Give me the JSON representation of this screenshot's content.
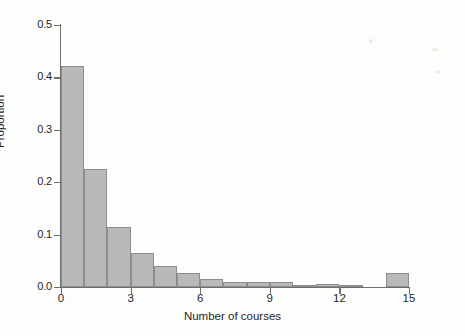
{
  "chart_data": {
    "type": "bar",
    "title": "",
    "subtitle": "",
    "xlabel": "Number of courses",
    "ylabel": "Proportion",
    "xlim": [
      0,
      15
    ],
    "ylim": [
      0,
      0.5
    ],
    "grid": false,
    "legend": null,
    "bin_width": 1,
    "x_ticks": [
      "0",
      "3",
      "6",
      "9",
      "12",
      "15"
    ],
    "x_tick_values": [
      0,
      3,
      6,
      9,
      12,
      15
    ],
    "y_ticks": [
      "0.0",
      "0.1",
      "0.2",
      "0.3",
      "0.4",
      "0.5"
    ],
    "y_tick_values": [
      0.0,
      0.1,
      0.2,
      0.3,
      0.4,
      0.5
    ],
    "bin_starts": [
      0,
      1,
      2,
      3,
      4,
      5,
      6,
      7,
      8,
      9,
      10,
      11,
      12,
      13,
      14
    ],
    "categories": [
      "0-1",
      "1-2",
      "2-3",
      "3-4",
      "4-5",
      "5-6",
      "6-7",
      "7-8",
      "8-9",
      "9-10",
      "10-11",
      "11-12",
      "12-13",
      "13-14",
      "14-15"
    ],
    "values": [
      0.422,
      0.225,
      0.115,
      0.065,
      0.04,
      0.027,
      0.016,
      0.01,
      0.01,
      0.01,
      0.004,
      0.006,
      0.002,
      0.0,
      0.027
    ],
    "bar_color": "#b9b9b9",
    "bar_edge_color": "#8d8d8d",
    "axis_color": "#6f6f6f",
    "background_color": "#fdfdfb"
  }
}
